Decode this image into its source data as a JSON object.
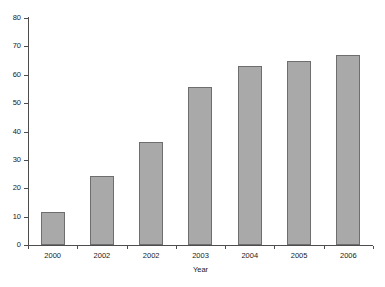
{
  "chart_data": {
    "type": "bar",
    "title": "",
    "subtitle": "",
    "xlabel": "Year",
    "ylabel": "",
    "categories": [
      "2000",
      "2002",
      "2002",
      "2003",
      "2004",
      "2005",
      "2006"
    ],
    "values": [
      11.6,
      24.3,
      36.3,
      55.6,
      63,
      65,
      67
    ],
    "series": [
      {
        "name": "",
        "values": [
          11.6,
          24.3,
          36.3,
          55.6,
          63,
          65,
          67
        ]
      }
    ],
    "ylim": [
      0,
      80
    ],
    "ytick_labels": [
      "0",
      "10",
      "20",
      "30",
      "40",
      "50",
      "60",
      "70",
      "80"
    ],
    "ytick_values": [
      0,
      10,
      20,
      30,
      40,
      50,
      60,
      70,
      80
    ],
    "grid": false,
    "legend": false,
    "legend_position": "none",
    "annotations": [],
    "colors": {
      "bar_fill": "#a9a9a9",
      "bar_edge": "#6e6e6e",
      "axis": "#4d4d4d",
      "text": "#1a1a1a",
      "background": "#ffffff"
    }
  }
}
